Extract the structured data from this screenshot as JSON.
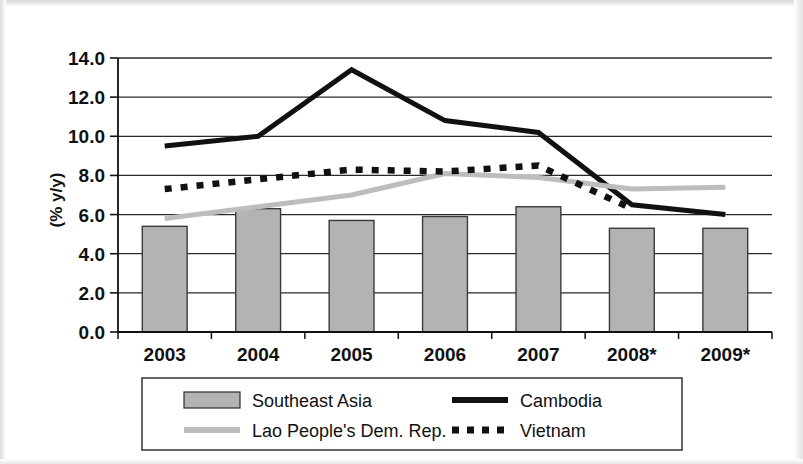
{
  "chart_data": {
    "type": "bar",
    "title": "",
    "xlabel": "",
    "ylabel": "(% y/y)",
    "ylim": [
      0.0,
      14.0
    ],
    "ytick_step": 2.0,
    "grid": true,
    "legend_position": "bottom",
    "categories": [
      "2003",
      "2004",
      "2005",
      "2006",
      "2007",
      "2008*",
      "2009*"
    ],
    "ytick_labels": [
      "0.0",
      "2.0",
      "4.0",
      "6.0",
      "8.0",
      "10.0",
      "12.0",
      "14.0"
    ],
    "series": [
      {
        "name": "Southeast Asia",
        "type": "bar",
        "color": "#b3b3b3",
        "values": [
          5.4,
          6.3,
          5.7,
          5.9,
          6.4,
          5.3,
          5.3
        ]
      },
      {
        "name": "Cambodia",
        "type": "line",
        "style": "solid",
        "color": "#111111",
        "values": [
          9.5,
          10.0,
          13.4,
          10.8,
          10.2,
          6.5,
          6.0
        ]
      },
      {
        "name": "Lao People's Dem. Rep.",
        "type": "line",
        "style": "solid",
        "color": "#bdbdbd",
        "values": [
          5.8,
          6.4,
          7.0,
          8.1,
          7.9,
          7.3,
          7.4
        ]
      },
      {
        "name": "Vietnam",
        "type": "line",
        "style": "dotted",
        "color": "#111111",
        "values": [
          7.3,
          7.8,
          8.3,
          8.2,
          8.5,
          6.3,
          null
        ]
      }
    ]
  },
  "legend": {
    "items": [
      {
        "label": "Southeast Asia",
        "swatch": "bar-swatch"
      },
      {
        "label": "Cambodia",
        "swatch": "solid-black-line-swatch"
      },
      {
        "label": "Lao People's Dem. Rep.",
        "swatch": "solid-gray-line-swatch"
      },
      {
        "label": "Vietnam",
        "swatch": "dotted-black-line-swatch"
      }
    ]
  },
  "axis": {
    "y_title": "(% y/y)"
  }
}
